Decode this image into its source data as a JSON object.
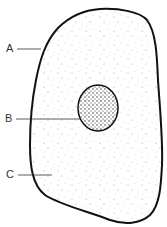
{
  "diagram": {
    "type": "cell",
    "labels": [
      {
        "id": "A",
        "text": "A",
        "points_to": "cell-membrane"
      },
      {
        "id": "B",
        "text": "B",
        "points_to": "nucleus"
      },
      {
        "id": "C",
        "text": "C",
        "points_to": "cytoplasm"
      }
    ],
    "colors": {
      "outline": "#111111",
      "stipple": "#777777",
      "nucleus_fill": "#f2f2f2",
      "background": "#ffffff"
    }
  }
}
